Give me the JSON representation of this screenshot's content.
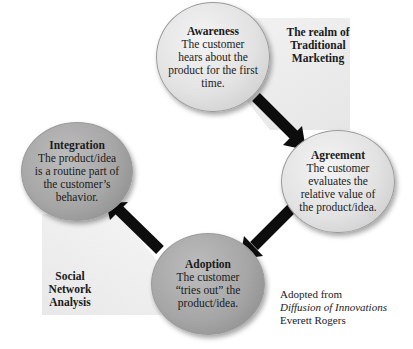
{
  "diagram": {
    "type": "cycle",
    "nodes": [
      {
        "id": "awareness",
        "title": "Awareness",
        "description": "The customer hears about the product for the first time.",
        "desc_lines": [
          "The customer",
          "hears about the",
          "product for the first",
          "time."
        ],
        "tone": "light"
      },
      {
        "id": "agreement",
        "title": "Agreement",
        "description": "The customer evaluates the relative value of the product/idea.",
        "desc_lines": [
          "The customer",
          "evaluates the",
          "relative value of",
          "the product/idea."
        ],
        "tone": "light"
      },
      {
        "id": "adoption",
        "title": "Adoption",
        "description": "The customer “tries out” the product/idea.",
        "desc_lines": [
          "The customer",
          "“tries out” the",
          "product/idea."
        ],
        "tone": "dark"
      },
      {
        "id": "integration",
        "title": "Integration",
        "description": "The product/idea is a routine part of the customer’s behavior.",
        "desc_lines": [
          "The product/idea",
          "is a routine part of",
          "the customer’s",
          "behavior."
        ],
        "tone": "dark"
      }
    ],
    "edges": [
      {
        "from": "awareness",
        "to": "agreement"
      },
      {
        "from": "agreement",
        "to": "adoption"
      },
      {
        "from": "adoption",
        "to": "integration"
      }
    ],
    "regions": {
      "traditional": {
        "lines": [
          "The realm of",
          "Traditional",
          "Marketing"
        ]
      },
      "social": {
        "lines": [
          "Social",
          "Network",
          "Analysis"
        ]
      }
    },
    "credit": {
      "line1": "Adopted from",
      "book": "Diffusion of Innovations",
      "author": "Everett Rogers"
    }
  },
  "colors": {
    "background": "#ffffff",
    "region_shade": "#ececec",
    "circle_light": "#e2e2e2",
    "circle_dark": "#a6a6a6",
    "arrow": "#0d0d0d",
    "text": "#1a1a1a"
  }
}
